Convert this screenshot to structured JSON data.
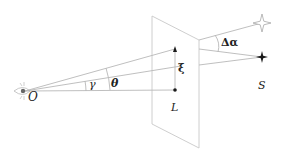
{
  "diagram": {
    "labels": {
      "observer": "O",
      "lens": "L",
      "source": "S",
      "gamma": "γ",
      "theta": "θ",
      "xi": "ξ",
      "deflection": "Δα"
    },
    "points": {
      "observer": {
        "x": 23,
        "y": 91
      },
      "lens": {
        "x": 175,
        "y": 90
      },
      "image_on_lens_plane": {
        "x": 175,
        "y": 49
      },
      "source": {
        "x": 262,
        "y": 57
      },
      "apparent_source": {
        "x": 262,
        "y": 23
      }
    },
    "lens_plane": {
      "corners": [
        [
          152,
          16
        ],
        [
          199,
          40
        ],
        [
          199,
          148
        ],
        [
          152,
          124
        ]
      ]
    },
    "colors": {
      "line": "#b8b8b8",
      "plane": "#c8c8c8",
      "ink": "#1a1a1a",
      "apparent_star": "#a8a8a8"
    }
  }
}
